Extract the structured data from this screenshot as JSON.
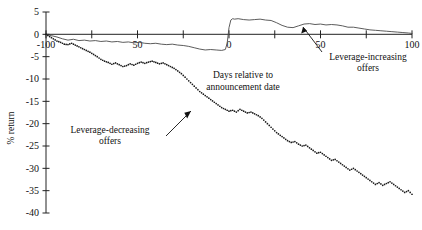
{
  "chart_data": {
    "type": "line",
    "title": "",
    "xlabel": "Days relative to announcement date",
    "ylabel": "% return",
    "xlim": [
      -100,
      100
    ],
    "ylim": [
      -40,
      5
    ],
    "xticks": [
      -100,
      -75,
      -50,
      -25,
      0,
      25,
      50,
      75,
      100
    ],
    "xtick_labels": [
      "-100",
      "",
      "50",
      "",
      "0",
      "",
      "50",
      "",
      "100"
    ],
    "yticks": [
      5,
      0,
      -5,
      -10,
      -15,
      -20,
      -25,
      -30,
      -35,
      -40
    ],
    "ytick_labels": [
      "5",
      "0",
      "-5",
      "-10",
      "-15",
      "-20",
      "-25",
      "-30",
      "-35",
      "-40"
    ],
    "grid": false,
    "legend_position": "annotations-inline",
    "series": [
      {
        "name": "Leverage-increasing offers",
        "style": "solid",
        "color": "#4a4a4a",
        "x": [
          -100,
          -97,
          -94,
          -91,
          -88,
          -85,
          -82,
          -79,
          -76,
          -73,
          -70,
          -67,
          -64,
          -61,
          -58,
          -55,
          -52,
          -49,
          -46,
          -43,
          -40,
          -37,
          -34,
          -31,
          -28,
          -25,
          -22,
          -19,
          -16,
          -13,
          -10,
          -7,
          -4,
          -2,
          -1,
          0,
          1,
          2,
          3,
          5,
          8,
          11,
          14,
          17,
          20,
          23,
          26,
          29,
          32,
          35,
          38,
          41,
          44,
          47,
          50,
          53,
          56,
          59,
          62,
          65,
          68,
          71,
          74,
          77,
          80,
          83,
          86,
          89,
          92,
          95,
          98,
          100
        ],
        "y": [
          0,
          -0.3,
          -0.6,
          -1.0,
          -1.3,
          -1.1,
          -1.4,
          -1.3,
          -1.5,
          -1.4,
          -1.6,
          -1.5,
          -1.7,
          -1.6,
          -1.8,
          -1.7,
          -1.9,
          -1.8,
          -2.0,
          -2.1,
          -2.0,
          -2.2,
          -2.3,
          -2.2,
          -2.4,
          -2.5,
          -2.7,
          -3.0,
          -3.3,
          -3.5,
          -3.4,
          -3.5,
          -3.6,
          -3.4,
          -2.0,
          1.5,
          3.2,
          3.5,
          3.4,
          3.5,
          3.3,
          3.2,
          3.3,
          3.4,
          3.2,
          3.1,
          2.6,
          2.0,
          1.6,
          1.5,
          1.9,
          2.3,
          2.4,
          2.2,
          2.3,
          2.1,
          2.2,
          2.1,
          1.9,
          1.6,
          1.6,
          1.4,
          1.2,
          1.0,
          0.9,
          0.8,
          0.7,
          0.6,
          0.5,
          0.4,
          0.3,
          0.2
        ]
      },
      {
        "name": "Leverage-decreasing offers",
        "style": "dotted",
        "color": "#1a1a1a",
        "x": [
          -100,
          -98,
          -96,
          -94,
          -92,
          -90,
          -88,
          -86,
          -84,
          -82,
          -80,
          -78,
          -76,
          -74,
          -72,
          -70,
          -68,
          -66,
          -64,
          -62,
          -60,
          -58,
          -56,
          -54,
          -52,
          -50,
          -48,
          -46,
          -44,
          -42,
          -40,
          -38,
          -36,
          -34,
          -32,
          -30,
          -28,
          -26,
          -24,
          -22,
          -20,
          -18,
          -16,
          -14,
          -12,
          -10,
          -8,
          -6,
          -4,
          -2,
          0,
          2,
          4,
          6,
          8,
          10,
          12,
          14,
          16,
          18,
          20,
          22,
          24,
          26,
          28,
          30,
          32,
          34,
          36,
          38,
          40,
          42,
          44,
          46,
          48,
          50,
          52,
          54,
          56,
          58,
          60,
          62,
          64,
          66,
          68,
          70,
          72,
          74,
          76,
          78,
          80,
          82,
          84,
          86,
          88,
          90,
          92,
          94,
          96,
          98,
          100
        ],
        "y": [
          0,
          -0.5,
          -1.0,
          -1.5,
          -1.8,
          -2.2,
          -2.3,
          -2.0,
          -2.4,
          -2.8,
          -3.2,
          -3.6,
          -4.0,
          -4.5,
          -5.0,
          -5.6,
          -6.0,
          -6.3,
          -6.7,
          -6.4,
          -6.8,
          -7.2,
          -7.0,
          -6.6,
          -6.9,
          -6.5,
          -6.2,
          -6.5,
          -6.2,
          -6.0,
          -6.3,
          -6.6,
          -6.4,
          -6.8,
          -7.2,
          -7.6,
          -8.2,
          -8.8,
          -9.6,
          -10.4,
          -11.2,
          -12.0,
          -12.8,
          -13.4,
          -14.0,
          -14.6,
          -15.2,
          -15.8,
          -16.4,
          -16.8,
          -17.2,
          -17.0,
          -17.4,
          -16.8,
          -17.2,
          -17.6,
          -17.4,
          -17.8,
          -18.2,
          -18.8,
          -19.6,
          -20.4,
          -21.2,
          -22.0,
          -22.6,
          -23.2,
          -23.8,
          -24.2,
          -24.0,
          -24.6,
          -25.0,
          -24.8,
          -25.4,
          -26.0,
          -26.6,
          -26.4,
          -27.0,
          -27.6,
          -28.2,
          -28.0,
          -28.6,
          -29.2,
          -29.8,
          -30.4,
          -30.0,
          -30.6,
          -31.2,
          -31.8,
          -32.4,
          -33.0,
          -33.6,
          -33.2,
          -33.8,
          -33.4,
          -33.0,
          -33.6,
          -34.2,
          -34.8,
          -35.4,
          -35.0,
          -35.8
        ]
      }
    ],
    "annotations": [
      {
        "name": "leverage-increasing-offers",
        "text_line1": "Leverage-increasing",
        "text_line2": "offers",
        "points_to_x": 32,
        "points_to_y": 1.8
      },
      {
        "name": "leverage-decreasing-offers",
        "text_line1": "Leverage-decreasing",
        "text_line2": "offers",
        "points_to_x": -8,
        "points_to_y": -15.4
      }
    ],
    "axis_label_lines": {
      "xlabel_line1": "Days relative to",
      "xlabel_line2": "announcement date"
    }
  }
}
